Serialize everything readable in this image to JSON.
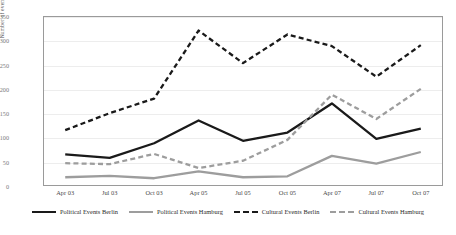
{
  "chart_data": {
    "type": "line",
    "title": "",
    "xlabel": "",
    "ylabel": "Number of events",
    "ylim": [
      0,
      350
    ],
    "ytick_values": [
      0,
      50,
      100,
      150,
      200,
      250,
      300,
      350
    ],
    "ytick_labels": [
      "0",
      "50",
      "100",
      "150",
      "200",
      "250",
      "300",
      "350"
    ],
    "grid": true,
    "legend_position": "bottom",
    "categories": [
      "Apr 03",
      "Jul 03",
      "Oct 03",
      "Apr 05",
      "Jul 05",
      "Oct 05",
      "Apr 07",
      "Jul 07",
      "Oct 07"
    ],
    "series": [
      {
        "name": "Political Events Berlin",
        "color": "#1a1a1a",
        "style": "solid",
        "values": [
          65,
          58,
          88,
          135,
          93,
          110,
          170,
          97,
          118
        ]
      },
      {
        "name": "Political Events Hamburg",
        "color": "#9d9d9d",
        "style": "solid",
        "values": [
          18,
          21,
          16,
          30,
          18,
          20,
          62,
          46,
          70
        ]
      },
      {
        "name": "Cultural Events Berlin",
        "color": "#1a1a1a",
        "style": "dashed",
        "values": [
          115,
          150,
          180,
          320,
          253,
          312,
          288,
          225,
          290
        ]
      },
      {
        "name": "Cultural Events Hamburg",
        "color": "#9d9d9d",
        "style": "dashed",
        "values": [
          47,
          45,
          66,
          37,
          52,
          95,
          188,
          138,
          200
        ]
      }
    ]
  }
}
